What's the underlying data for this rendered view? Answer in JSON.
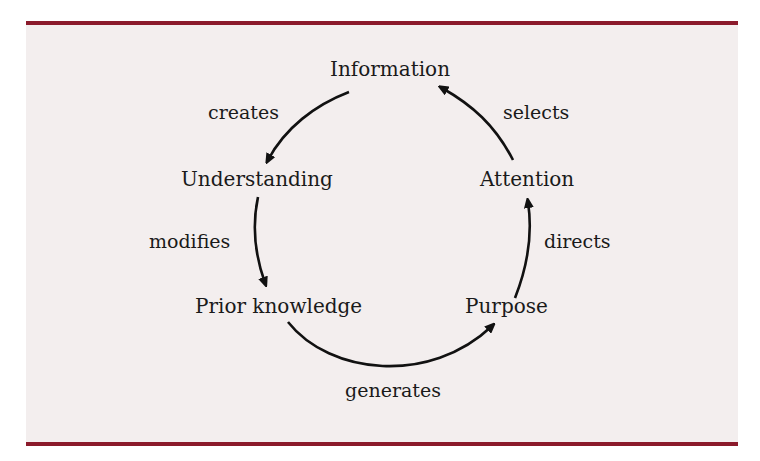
{
  "diagram": {
    "colors": {
      "border": "#8b1a2b",
      "background": "#f3eeee",
      "ink": "#1a1a1a"
    },
    "nodes": [
      {
        "id": "information",
        "label": "Information"
      },
      {
        "id": "understanding",
        "label": "Understanding"
      },
      {
        "id": "prior_knowledge",
        "label": "Prior knowledge"
      },
      {
        "id": "purpose",
        "label": "Purpose"
      },
      {
        "id": "attention",
        "label": "Attention"
      }
    ],
    "edges": [
      {
        "from": "Information",
        "to": "Understanding",
        "label": "creates"
      },
      {
        "from": "Understanding",
        "to": "Prior knowledge",
        "label": "modifies"
      },
      {
        "from": "Prior knowledge",
        "to": "Purpose",
        "label": "generates"
      },
      {
        "from": "Purpose",
        "to": "Attention",
        "label": "directs"
      },
      {
        "from": "Attention",
        "to": "Information",
        "label": "selects"
      }
    ]
  }
}
